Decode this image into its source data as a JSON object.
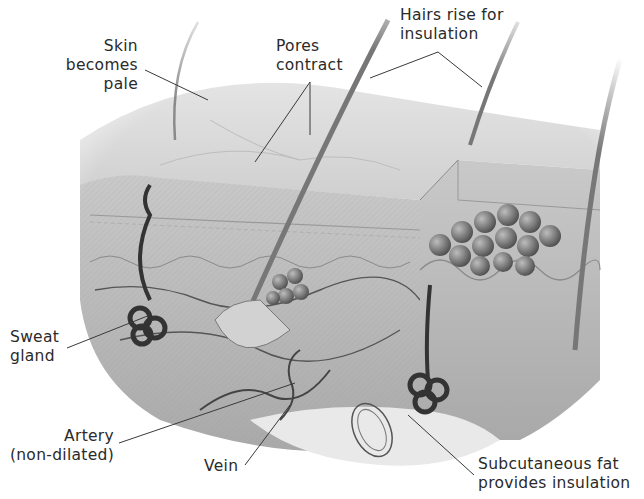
{
  "diagram": {
    "colors": {
      "background": "#ffffff",
      "skin": "#d8d8d8",
      "tissue": "#b9b9b9",
      "dark": "#3a3a3a",
      "fat": "#e9e9e9",
      "text": "#2a2a2a"
    },
    "labels": {
      "skin_pale": {
        "line1": "Skin",
        "line2": "becomes",
        "line3": "pale"
      },
      "pores": {
        "line1": "Pores",
        "line2": "contract"
      },
      "hairs": {
        "line1": "Hairs rise for",
        "line2": "insulation"
      },
      "sweat": {
        "line1": "Sweat",
        "line2": "gland"
      },
      "artery": {
        "line1": "Artery",
        "line2": "(non-dilated)"
      },
      "vein": {
        "line1": "Vein"
      },
      "fat": {
        "line1": "Subcutaneous fat",
        "line2": "provides insulation"
      }
    }
  }
}
